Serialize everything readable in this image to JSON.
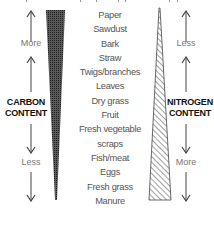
{
  "diagram": {
    "materials": [
      "Paper",
      "Sawdust",
      "Bark",
      "Straw",
      "Twigs/branches",
      "Leaves",
      "Dry grass",
      "Fruit",
      "Fresh vegetable",
      "scraps",
      "Fish/meat",
      "Eggs",
      "Fresh grass",
      "Manure"
    ],
    "carbon": {
      "title_line1": "CARBON",
      "title_line2": "CONTENT",
      "top_label": "More",
      "bottom_label": "Less",
      "wedge_pattern": "dense-grid",
      "wedge_direction": "wide-top-narrow-bottom"
    },
    "nitrogen": {
      "title_line1": "NITROGEN",
      "title_line2": "CONTENT",
      "top_label": "Less",
      "bottom_label": "More",
      "wedge_pattern": "diagonal-hatch",
      "wedge_direction": "narrow-top-wide-bottom"
    },
    "icons": {
      "up": "arrow-up-icon",
      "down": "arrow-down-icon"
    },
    "colors": {
      "carbon_fill": "#3a3a3a",
      "nitrogen_hatch": "#444444",
      "text": "#555555",
      "title": "#111111"
    }
  }
}
